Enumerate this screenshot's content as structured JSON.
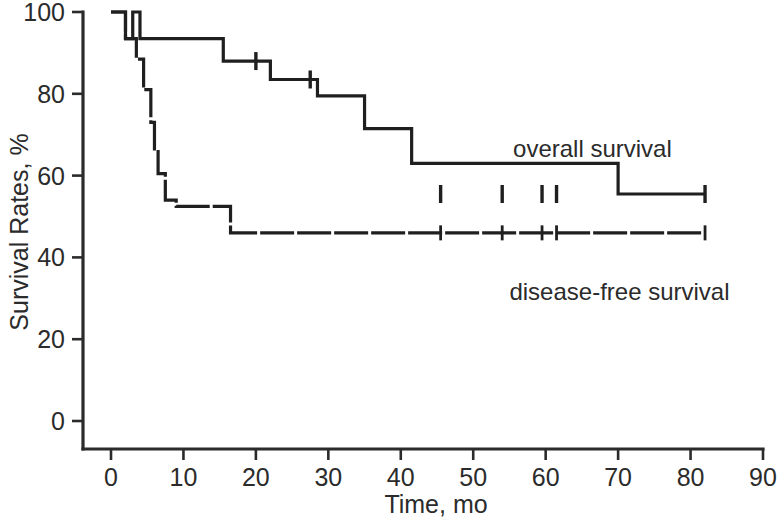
{
  "chart_data": {
    "type": "line",
    "subtype": "kaplan-meier-step",
    "title": "",
    "xlabel": "Time, mo",
    "ylabel": "Survival Rates, %",
    "xlim": [
      0,
      90
    ],
    "ylim": [
      0,
      100
    ],
    "xticks": [
      0,
      10,
      20,
      30,
      40,
      50,
      60,
      70,
      80,
      90
    ],
    "xtick_labels": [
      "0",
      "10",
      "20",
      "30",
      "40",
      "50",
      "60",
      "70",
      "80",
      "90"
    ],
    "yticks": [
      0,
      20,
      40,
      60,
      80,
      100
    ],
    "ytick_labels": [
      "0",
      "20",
      "40",
      "60",
      "80",
      "100"
    ],
    "grid": false,
    "legend_position": "inside-right",
    "series": [
      {
        "name": "overall survival",
        "label": "overall survival",
        "color": "#1f1f1f",
        "line_style": "solid",
        "label_x": 55.5,
        "label_y": 64.5,
        "steps": [
          [
            0,
            100
          ],
          [
            2.0,
            100
          ],
          [
            2.0,
            93.5
          ],
          [
            3.0,
            93.5
          ],
          [
            3.0,
            100
          ],
          [
            4.0,
            100
          ],
          [
            4.0,
            93.5
          ],
          [
            15.5,
            93.5
          ],
          [
            15.5,
            88.0
          ],
          [
            22.0,
            88.0
          ],
          [
            22.0,
            83.5
          ],
          [
            28.5,
            83.5
          ],
          [
            28.5,
            79.5
          ],
          [
            35.0,
            79.5
          ],
          [
            35.0,
            71.5
          ],
          [
            41.5,
            71.5
          ],
          [
            41.5,
            63.0
          ],
          [
            70.0,
            63.0
          ],
          [
            70.0,
            55.5
          ],
          [
            110.0,
            55.5
          ]
        ],
        "censored": [
          [
            20.0,
            88.0
          ],
          [
            27.5,
            83.5
          ],
          [
            45.5,
            55.5
          ],
          [
            54.0,
            55.5
          ],
          [
            59.5,
            55.5
          ],
          [
            61.5,
            55.5
          ],
          [
            82.0,
            55.5
          ]
        ],
        "plateau_value": 55.5,
        "final_time": 82.0
      },
      {
        "name": "disease-free survival",
        "label": "disease-free survival",
        "color": "#1f1f1f",
        "line_style": "dashed",
        "label_x": 55.0,
        "label_y": 29.5,
        "steps": [
          [
            0,
            100
          ],
          [
            2.0,
            100
          ],
          [
            2.0,
            93.5
          ],
          [
            3.5,
            93.5
          ],
          [
            3.5,
            88.5
          ],
          [
            4.5,
            88.5
          ],
          [
            4.5,
            81.0
          ],
          [
            5.5,
            81.0
          ],
          [
            5.5,
            73.0
          ],
          [
            6.0,
            73.0
          ],
          [
            6.0,
            66.5
          ],
          [
            6.5,
            66.5
          ],
          [
            6.5,
            60.5
          ],
          [
            7.5,
            60.5
          ],
          [
            7.5,
            54.0
          ],
          [
            9.0,
            54.0
          ],
          [
            9.0,
            52.5
          ],
          [
            16.5,
            52.5
          ],
          [
            16.5,
            46.0
          ],
          [
            110.0,
            46.0
          ]
        ],
        "censored": [
          [
            45.5,
            46.0
          ],
          [
            54.0,
            46.0
          ],
          [
            59.5,
            46.0
          ],
          [
            61.5,
            46.0
          ],
          [
            82.0,
            46.0
          ]
        ],
        "plateau_value": 46.0,
        "final_time": 82.0
      }
    ],
    "annotations": [
      {
        "text": "overall survival",
        "x": 55.5,
        "y": 64.5
      },
      {
        "text": "disease-free survival",
        "x": 55.0,
        "y": 29.5
      }
    ]
  },
  "axes": {
    "x_title": "Time, mo",
    "y_title": "Survival Rates, %"
  },
  "colors": {
    "ink": "#1f1f1f",
    "axis": "#2b2b2b",
    "background": "#ffffff"
  }
}
